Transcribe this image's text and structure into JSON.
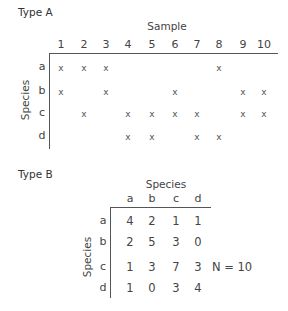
{
  "type_a": {
    "title": "Type A",
    "column_axis_label": "Sample",
    "row_axis_label": "Species",
    "columns": [
      "1",
      "2",
      "3",
      "4",
      "5",
      "6",
      "7",
      "8",
      "9",
      "10"
    ],
    "rows": [
      "a",
      "b",
      "c",
      "d"
    ],
    "mark_symbol": "x",
    "presence": {
      "a": [
        1,
        2,
        3,
        8
      ],
      "b": [
        1,
        3,
        6,
        9,
        10
      ],
      "c": [
        2,
        4,
        5,
        6,
        7,
        9,
        10
      ],
      "d": [
        4,
        5,
        7,
        8
      ]
    }
  },
  "type_b": {
    "title": "Type B",
    "column_axis_label": "Species",
    "row_axis_label": "Species",
    "columns": [
      "a",
      "b",
      "c",
      "d"
    ],
    "rows": [
      "a",
      "b",
      "c",
      "d"
    ],
    "matrix": [
      [
        "4",
        "2",
        "1",
        "1"
      ],
      [
        "2",
        "5",
        "3",
        "0"
      ],
      [
        "1",
        "3",
        "7",
        "3"
      ],
      [
        "1",
        "0",
        "3",
        "4"
      ]
    ],
    "n_label": "N = 10"
  }
}
